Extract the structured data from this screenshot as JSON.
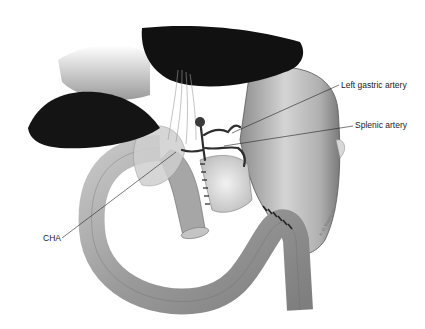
{
  "figure": {
    "type": "anatomical illustration",
    "labels": [
      {
        "id": "left-gastric-artery",
        "text": "Left gastric artery"
      },
      {
        "id": "splenic-artery",
        "text": "Splenic artery"
      },
      {
        "id": "cha",
        "text": "CHA"
      }
    ],
    "signature": "K. O. Wagner '12",
    "colors": {
      "background": "#ffffff",
      "liver": "#111111",
      "bowel": "#a8a8a8",
      "stomach": "#b8b8b8",
      "leader_line": "#222222"
    }
  }
}
